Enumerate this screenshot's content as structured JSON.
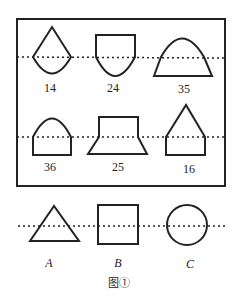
{
  "figure": {
    "caption": "图①",
    "panel_shapes": [
      {
        "id": "14",
        "label": "14",
        "description": "semicircle bottom with triangle top"
      },
      {
        "id": "24",
        "label": "24",
        "description": "semicircle bottom with square top"
      },
      {
        "id": "35",
        "label": "35",
        "description": "semicircle top with trapezoid bottom"
      },
      {
        "id": "36",
        "label": "36",
        "description": "semicircle top with square bottom"
      },
      {
        "id": "25",
        "label": "25",
        "description": "square top with trapezoid bottom"
      },
      {
        "id": "16",
        "label": "16",
        "description": "triangle top with square bottom"
      }
    ],
    "base_shapes": [
      {
        "id": "A",
        "label": "A",
        "description": "triangle"
      },
      {
        "id": "B",
        "label": "B",
        "description": "square"
      },
      {
        "id": "C",
        "label": "C",
        "description": "circle"
      }
    ]
  }
}
